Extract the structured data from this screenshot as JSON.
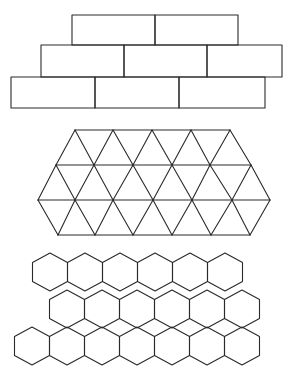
{
  "figure": {
    "stroke_color": "#2a2a2a",
    "background": "#ffffff",
    "panels": [
      {
        "name": "brick-tiling",
        "shape": "rectangle",
        "rows": [
          {
            "y_top": 15,
            "y_bottom": 45,
            "x_edges": [
              72,
              155,
              238
            ]
          },
          {
            "y_top": 45,
            "y_bottom": 77,
            "x_edges": [
              41,
              124,
              207,
              282
            ]
          },
          {
            "y_top": 77,
            "y_bottom": 108,
            "x_edges": [
              11,
              95,
              179,
              265
            ]
          }
        ]
      },
      {
        "name": "triangle-tiling",
        "shape": "triangle",
        "vertex_rows": [
          {
            "y": 130,
            "x": [
              75,
              113,
              152,
              191,
              230
            ]
          },
          {
            "y": 165,
            "x": [
              56,
              94,
              133,
              172,
              210,
              251
            ]
          },
          {
            "y": 200,
            "x": [
              38,
              75,
              113,
              153,
              192,
              232,
              270
            ]
          },
          {
            "y": 235,
            "x": [
              58,
              95,
              133,
              172,
              211,
              250
            ]
          }
        ]
      },
      {
        "name": "hexagon-tiling",
        "shape": "hexagon",
        "radius": 19,
        "rows": [
          {
            "cy": 272,
            "cx": [
              50,
              85,
              120,
              155,
              190,
              225
            ]
          },
          {
            "cy": 309,
            "cx": [
              67,
              102,
              137,
              172,
              207,
              242
            ]
          },
          {
            "cy": 346,
            "cx": [
              32,
              67,
              102,
              137,
              172,
              207,
              242
            ]
          }
        ]
      }
    ]
  }
}
